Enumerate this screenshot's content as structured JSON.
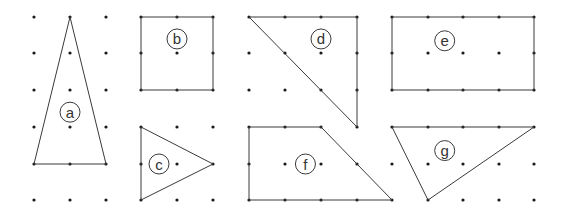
{
  "diagram": {
    "colors": {
      "line": "#3a3a3a",
      "dot": "#1a1a1a",
      "background": "#ffffff"
    },
    "grid": {
      "columns": 15,
      "rows": 6
    },
    "shapes": [
      {
        "label": "a",
        "type": "triangle",
        "vertices": [
          [
            1,
            0
          ],
          [
            0,
            4
          ],
          [
            2,
            4
          ]
        ],
        "label_at": [
          1,
          2.6
        ]
      },
      {
        "label": "b",
        "type": "square",
        "vertices": [
          [
            3,
            0
          ],
          [
            5,
            0
          ],
          [
            5,
            2
          ],
          [
            3,
            2
          ]
        ],
        "label_at": [
          4,
          0.6
        ]
      },
      {
        "label": "c",
        "type": "triangle",
        "vertices": [
          [
            3,
            3
          ],
          [
            5,
            4
          ],
          [
            3,
            5
          ]
        ],
        "label_at": [
          3.5,
          4
        ]
      },
      {
        "label": "d",
        "type": "triangle",
        "vertices": [
          [
            6,
            0
          ],
          [
            9,
            0
          ],
          [
            9,
            3
          ]
        ],
        "label_at": [
          8,
          0.6
        ]
      },
      {
        "label": "e",
        "type": "rectangle",
        "vertices": [
          [
            10,
            0
          ],
          [
            14,
            0
          ],
          [
            14,
            2
          ],
          [
            10,
            2
          ]
        ],
        "label_at": [
          11.5,
          0.65
        ]
      },
      {
        "label": "f",
        "type": "trapezoid",
        "vertices": [
          [
            6,
            3
          ],
          [
            8,
            3
          ],
          [
            10,
            5
          ],
          [
            6,
            5
          ]
        ],
        "label_at": [
          7.6,
          4
        ]
      },
      {
        "label": "g",
        "type": "triangle",
        "vertices": [
          [
            10,
            3
          ],
          [
            14,
            3
          ],
          [
            11,
            5
          ]
        ],
        "label_at": [
          11.5,
          3.65
        ]
      }
    ]
  }
}
